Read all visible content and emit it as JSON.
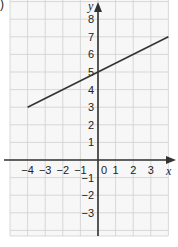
{
  "part_label": ")",
  "chart_data": {
    "type": "line",
    "title": "",
    "xlabel": "x",
    "ylabel": "y",
    "xlim": [
      -5,
      4
    ],
    "ylim": [
      -4,
      9
    ],
    "grid": true,
    "x_ticks": [
      -4,
      -3,
      -2,
      -1,
      0,
      1,
      2,
      3
    ],
    "y_ticks": [
      -3,
      -2,
      -1,
      1,
      2,
      3,
      4,
      5,
      6,
      7,
      8
    ],
    "x_tick_labels": [
      "−4",
      "−3",
      "−2",
      "−1",
      "0",
      "1",
      "2",
      "3"
    ],
    "y_tick_labels": [
      "−3",
      "−2",
      "−1",
      "1",
      "2",
      "3",
      "4",
      "5",
      "6",
      "7",
      "8"
    ],
    "series": [
      {
        "name": "y = 0.5x + 5",
        "x": [
          -4,
          4
        ],
        "y": [
          3,
          7
        ],
        "color": "#333333"
      }
    ],
    "equation": "y = 0.5x + 5"
  },
  "colors": {
    "grid": "#cfcfcf",
    "axis": "#333333",
    "line": "#333333",
    "background": "#f7f7f7"
  }
}
